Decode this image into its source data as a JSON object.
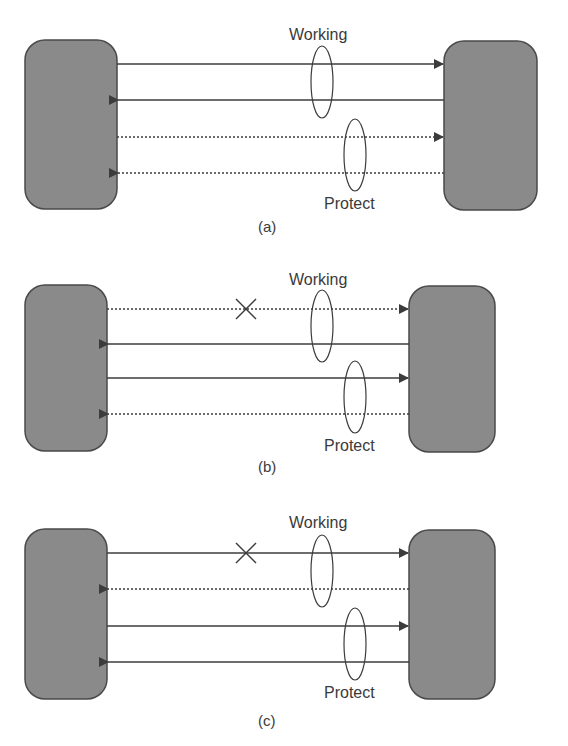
{
  "figure": {
    "panels": [
      {
        "id": "a",
        "caption": "(a)",
        "working_label": "Working",
        "protect_label": "Protect",
        "links": [
          {
            "direction": "right",
            "style": "solid",
            "group": "working",
            "failed": false
          },
          {
            "direction": "left",
            "style": "solid",
            "group": "working",
            "failed": false
          },
          {
            "direction": "right",
            "style": "dashed",
            "group": "protect",
            "failed": false
          },
          {
            "direction": "left",
            "style": "dashed",
            "group": "protect",
            "failed": false
          }
        ]
      },
      {
        "id": "b",
        "caption": "(b)",
        "working_label": "Working",
        "protect_label": "Protect",
        "links": [
          {
            "direction": "right",
            "style": "dashed",
            "group": "working",
            "failed": true
          },
          {
            "direction": "left",
            "style": "solid",
            "group": "working",
            "failed": false
          },
          {
            "direction": "right",
            "style": "solid",
            "group": "protect",
            "failed": false
          },
          {
            "direction": "left",
            "style": "dashed",
            "group": "protect",
            "failed": false
          }
        ]
      },
      {
        "id": "c",
        "caption": "(c)",
        "working_label": "Working",
        "protect_label": "Protect",
        "links": [
          {
            "direction": "right",
            "style": "solid",
            "group": "working",
            "failed": true
          },
          {
            "direction": "left",
            "style": "dashed",
            "group": "working",
            "failed": false
          },
          {
            "direction": "right",
            "style": "solid",
            "group": "protect",
            "failed": false
          },
          {
            "direction": "left",
            "style": "solid",
            "group": "protect",
            "failed": false
          }
        ]
      }
    ],
    "colors": {
      "node_fill": "#8a8a8a",
      "node_stroke": "#4a4a4a",
      "line": "#3c3c3c",
      "text": "#3a3a3a"
    }
  }
}
